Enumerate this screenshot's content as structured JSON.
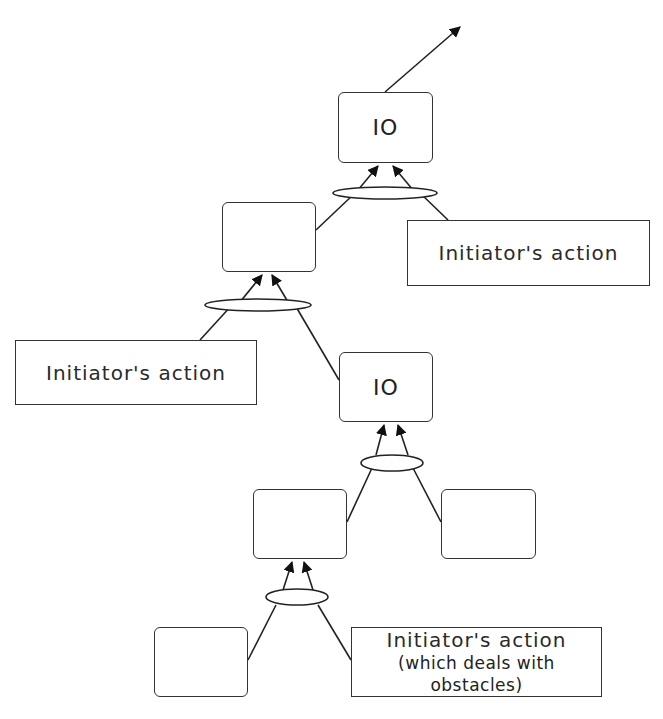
{
  "diagram": {
    "type": "goal-tree",
    "nodes": {
      "top_io": {
        "label": "IO"
      },
      "mid_left_goal": {
        "label": ""
      },
      "top_action": {
        "label": "Initiator's action"
      },
      "left_action": {
        "label": "Initiator's action"
      },
      "mid_io": {
        "label": "IO"
      },
      "lower_left_goal": {
        "label": ""
      },
      "lower_right_goal": {
        "label": ""
      },
      "bottom_left_goal": {
        "label": ""
      },
      "bottom_action": {
        "label": "Initiator's action",
        "sublabel": "(which deals with obstacles)"
      }
    },
    "edges": [
      {
        "from": "top_io",
        "to": "outside",
        "arrow": true
      },
      {
        "from": "mid_left_goal",
        "to": "top_io",
        "via": "and-ellipse-1"
      },
      {
        "from": "top_action",
        "to": "top_io",
        "via": "and-ellipse-1"
      },
      {
        "from": "left_action",
        "to": "mid_left_goal",
        "via": "and-ellipse-2"
      },
      {
        "from": "mid_io",
        "to": "mid_left_goal",
        "via": "and-ellipse-2"
      },
      {
        "from": "lower_left_goal",
        "to": "mid_io",
        "via": "and-ellipse-3"
      },
      {
        "from": "lower_right_goal",
        "to": "mid_io",
        "via": "and-ellipse-3"
      },
      {
        "from": "bottom_left_goal",
        "to": "lower_left_goal",
        "via": "and-ellipse-4"
      },
      {
        "from": "bottom_action",
        "to": "lower_left_goal",
        "via": "and-ellipse-4"
      }
    ]
  }
}
